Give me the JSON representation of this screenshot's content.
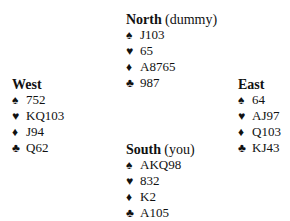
{
  "hands": {
    "north": {
      "name": "North",
      "role": "(dummy)",
      "spades": "J103",
      "hearts": "65",
      "diamonds": "A8765",
      "clubs": "987"
    },
    "west": {
      "name": "West",
      "role": "",
      "spades": "752",
      "hearts": "KQ103",
      "diamonds": "J94",
      "clubs": "Q62"
    },
    "east": {
      "name": "East",
      "role": "",
      "spades": "64",
      "hearts": "AJ97",
      "diamonds": "Q103",
      "clubs": "KJ43"
    },
    "south": {
      "name": "South",
      "role": "(you)",
      "spades": "AKQ98",
      "hearts": "832",
      "diamonds": "K2",
      "clubs": "A105"
    }
  },
  "suits": {
    "spade": "♠",
    "heart": "♥",
    "diamond": "♦",
    "club": "♣"
  }
}
